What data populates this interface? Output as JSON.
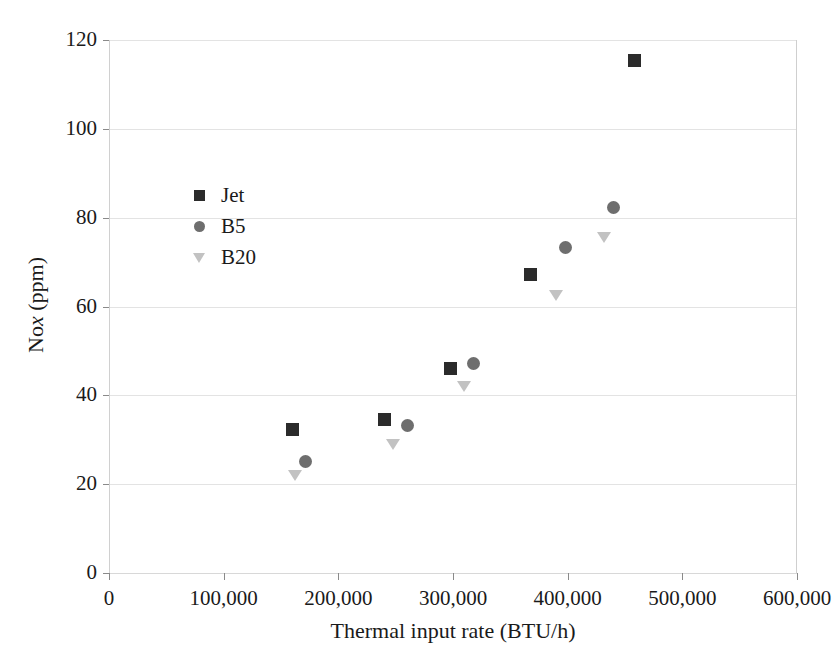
{
  "chart_data": {
    "type": "scatter",
    "title": "",
    "xlabel": "Thermal input rate (BTU/h)",
    "ylabel": "Nox (ppm)",
    "ylabel_parts": {
      "pre": "No",
      "italic": "x",
      "post": " (ppm)"
    },
    "xlim": [
      0,
      600000
    ],
    "ylim": [
      0,
      120
    ],
    "xticks": [
      0,
      100000,
      200000,
      300000,
      400000,
      500000,
      600000
    ],
    "xtick_labels": [
      "0",
      "100,000",
      "200,000",
      "300,000",
      "400,000",
      "500,000",
      "600,000"
    ],
    "yticks": [
      0,
      20,
      40,
      60,
      80,
      100,
      120
    ],
    "ytick_labels": [
      "0",
      "20",
      "40",
      "60",
      "80",
      "100",
      "120"
    ],
    "grid": "horizontal",
    "legend_position": "upper-left-inside",
    "series": [
      {
        "name": "Jet",
        "marker": "square",
        "color": "#2b2b2b",
        "points": [
          {
            "x": 160000,
            "y": 32.2
          },
          {
            "x": 240000,
            "y": 34.5
          },
          {
            "x": 298000,
            "y": 46.1
          },
          {
            "x": 368000,
            "y": 67.2
          },
          {
            "x": 458000,
            "y": 115.3
          }
        ]
      },
      {
        "name": "B5",
        "marker": "circle",
        "color": "#6e6e6e",
        "points": [
          {
            "x": 171000,
            "y": 25.1
          },
          {
            "x": 260000,
            "y": 33.3
          },
          {
            "x": 318000,
            "y": 47.2
          },
          {
            "x": 398000,
            "y": 73.3
          },
          {
            "x": 440000,
            "y": 82.3
          }
        ]
      },
      {
        "name": "B20",
        "marker": "triangle-down",
        "color": "#c2c2c2",
        "points": [
          {
            "x": 162000,
            "y": 22.1
          },
          {
            "x": 248000,
            "y": 29.0
          },
          {
            "x": 310000,
            "y": 42.2
          },
          {
            "x": 390000,
            "y": 62.6
          },
          {
            "x": 432000,
            "y": 75.6
          }
        ]
      }
    ]
  },
  "legend": {
    "items": [
      {
        "label": "Jet",
        "marker": "square"
      },
      {
        "label": "B5",
        "marker": "circle"
      },
      {
        "label": "B20",
        "marker": "triangle-down"
      }
    ]
  },
  "colors": {
    "background": "#ffffff",
    "grid": "#e3e3e3",
    "axis": "#8a8a8a",
    "text": "#1a1a1a",
    "jet": "#2b2b2b",
    "b5": "#6e6e6e",
    "b20": "#c2c2c2"
  }
}
